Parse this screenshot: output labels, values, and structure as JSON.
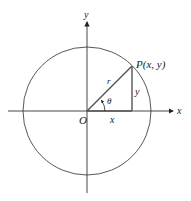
{
  "diagram": {
    "type": "polar-coordinates-unit-circle",
    "axes": {
      "x_label": "x",
      "y_label": "y",
      "origin_label": "O"
    },
    "point": {
      "label": "P(x, y)"
    },
    "segments": {
      "radius_label": "r",
      "horizontal_label": "x",
      "vertical_label": "y"
    },
    "angle": {
      "label": "θ"
    },
    "colors": {
      "line": "#333333",
      "triangle": "#555555",
      "background": "#ffffff"
    }
  }
}
